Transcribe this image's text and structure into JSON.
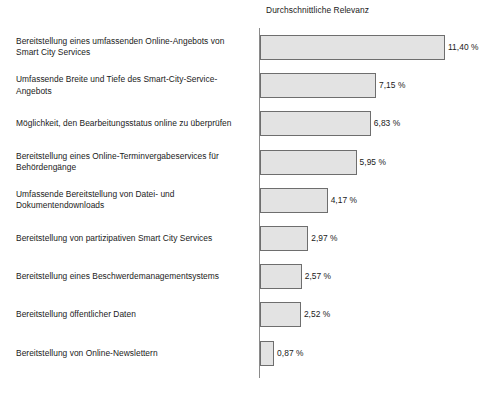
{
  "chart_data": {
    "type": "bar",
    "orientation": "horizontal",
    "title": "Durchschnittliche Relevanz",
    "xlabel": "",
    "ylabel": "",
    "value_suffix": " %",
    "decimal_separator": ",",
    "grid": false,
    "legend": null,
    "xlim": [
      0,
      11.4
    ],
    "axis_color": "#8a8a8a",
    "bar_fill": "#e3e3e3",
    "bar_stroke": "#6e6e6e",
    "text_color": "#1a1a1a",
    "categories": [
      "Bereitstellung eines umfassenden Online-Angebots von Smart City Services",
      "Umfassende Breite und Tiefe des Smart-City-Service-Angebots",
      "Möglichkeit, den Bearbeitungsstatus online zu überprüfen",
      "Bereitstellung eines Online-Terminvergabeservices für Behördengänge",
      "Umfassende Bereitstellung von Datei- und Dokumentendownloads",
      "Bereitstellung von partizipativen Smart City Services",
      "Bereitstellung eines Beschwerdemanagementsystems",
      "Bereitstellung öffentlicher Daten",
      "Bereitstellung von Online-Newslettern"
    ],
    "values": [
      11.4,
      7.15,
      6.83,
      5.95,
      4.17,
      2.97,
      2.57,
      2.52,
      0.87
    ],
    "value_labels": [
      "11,40 %",
      "7,15 %",
      "6,83 %",
      "5,95 %",
      "4,17 %",
      "2,97 %",
      "2,57 %",
      "2,52 %",
      "0,87 %"
    ]
  },
  "bars": [
    {
      "label_line1": "Bereitstellung eines umfassenden Online-Angebots von",
      "label_line2": "Smart City Services",
      "value_label": "11,40 %",
      "value": 11.4
    },
    {
      "label_line1": "Umfassende Breite und Tiefe des Smart-City-Service-",
      "label_line2": "Angebots",
      "value_label": "7,15 %",
      "value": 7.15
    },
    {
      "label_line1": "Möglichkeit, den Bearbeitungsstatus online zu überprüfen",
      "label_line2": "",
      "value_label": "6,83 %",
      "value": 6.83
    },
    {
      "label_line1": "Bereitstellung eines Online-Terminvergabeservices für",
      "label_line2": "Behördengänge",
      "value_label": "5,95 %",
      "value": 5.95
    },
    {
      "label_line1": "Umfassende Bereitstellung von Datei- und",
      "label_line2": "Dokumentendownloads",
      "value_label": "4,17 %",
      "value": 4.17
    },
    {
      "label_line1": "Bereitstellung von partizipativen Smart City Services",
      "label_line2": "",
      "value_label": "2,97 %",
      "value": 2.97
    },
    {
      "label_line1": "Bereitstellung eines Beschwerdemanagementsystems",
      "label_line2": "",
      "value_label": "2,57 %",
      "value": 2.57
    },
    {
      "label_line1": "Bereitstellung öffentlicher Daten",
      "label_line2": "",
      "value_label": "2,52 %",
      "value": 2.52
    },
    {
      "label_line1": "Bereitstellung von Online-Newslettern",
      "label_line2": "",
      "value_label": "0,87 %",
      "value": 0.87
    }
  ]
}
